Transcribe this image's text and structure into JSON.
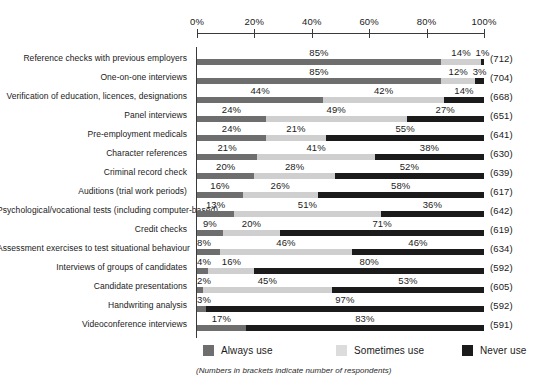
{
  "chart_data": {
    "type": "bar",
    "subtype": "stacked-horizontal-100",
    "title": "",
    "xlabel": "",
    "ylabel": "",
    "xlim": [
      0,
      100
    ],
    "xticks": [
      "0%",
      "20%",
      "40%",
      "60%",
      "80%",
      "100%"
    ],
    "xtick_values": [
      0,
      20,
      40,
      60,
      80,
      100
    ],
    "grid": false,
    "legend_position": "bottom",
    "categories": [
      "Reference checks with previous employers",
      "One-on-one interviews",
      "Verification of education, licences, designations",
      "Panel interviews",
      "Pre-employment medicals",
      "Character references",
      "Criminal record check",
      "Auditions (trial work periods)",
      "Psychological/vocational tests (including computer-based)",
      "Credit checks",
      "Assessment exercises to test situational behaviour",
      "Interviews of groups of candidates",
      "Candidate presentations",
      "Handwriting analysis",
      "Videoconference interviews"
    ],
    "series": [
      {
        "name": "Always use",
        "color": "#6e6e6e",
        "values": [
          85,
          85,
          44,
          24,
          24,
          21,
          20,
          16,
          13,
          9,
          8,
          4,
          2,
          3,
          17
        ],
        "labels": [
          "85%",
          "85%",
          "44%",
          "24%",
          "24%",
          "21%",
          "20%",
          "16%",
          "13%",
          "9%",
          "8%",
          "4%",
          "2%",
          "3%",
          "17%"
        ]
      },
      {
        "name": "Sometimes use",
        "color": "#cfcfcf",
        "values": [
          14,
          12,
          42,
          49,
          21,
          41,
          28,
          26,
          51,
          20,
          46,
          16,
          45,
          0,
          0
        ],
        "labels": [
          "14%",
          "12%",
          "42%",
          "49%",
          "21%",
          "41%",
          "28%",
          "26%",
          "51%",
          "20%",
          "46%",
          "16%",
          "45%",
          "",
          ""
        ]
      },
      {
        "name": "Never use",
        "color": "#1b1b1b",
        "values": [
          1,
          3,
          14,
          27,
          55,
          38,
          52,
          58,
          36,
          71,
          46,
          80,
          53,
          97,
          83
        ],
        "labels": [
          "1%",
          "3%",
          "14%",
          "27%",
          "55%",
          "38%",
          "52%",
          "58%",
          "36%",
          "71%",
          "46%",
          "80%",
          "53%",
          "97%",
          "83%"
        ]
      }
    ],
    "respondents": [
      "(712)",
      "(704)",
      "(668)",
      "(651)",
      "(641)",
      "(630)",
      "(639)",
      "(617)",
      "(642)",
      "(619)",
      "(634)",
      "(592)",
      "(605)",
      "(592)",
      "(591)"
    ]
  },
  "legend": {
    "items": [
      {
        "label": "Always use",
        "swatch": "always"
      },
      {
        "label": "Sometimes use",
        "swatch": "sometimes"
      },
      {
        "label": "Never use",
        "swatch": "never"
      }
    ]
  },
  "footnote": "(Numbers in brackets indicate number of respondents)",
  "colors": {
    "always": "#6e6e6e",
    "sometimes": "#cfcfcf",
    "never": "#1b1b1b",
    "axis": "#3a3a3a",
    "text": "#1a1a1a",
    "background": "#ffffff"
  }
}
